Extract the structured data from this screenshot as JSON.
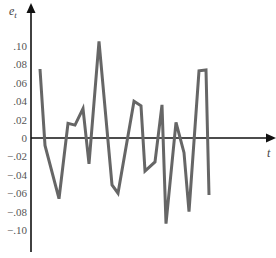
{
  "chart_data": {
    "type": "line",
    "title": "",
    "xlabel": "t",
    "ylabel": "e_t",
    "ylabel_main": "e",
    "ylabel_sub": "t",
    "yticks": [
      ".10",
      ".08",
      ".06",
      ".04",
      ".02",
      "0",
      "−.02",
      "−.04",
      "−.06",
      "−.08",
      "−.10"
    ],
    "ytick_values": [
      0.1,
      0.08,
      0.06,
      0.04,
      0.02,
      0,
      -0.02,
      -0.04,
      -0.06,
      -0.08,
      -0.1
    ],
    "ylim": [
      -0.12,
      0.14
    ],
    "grid": false,
    "legend": null,
    "series": [
      {
        "name": "e_t",
        "color": "#666666",
        "x": [
          40,
          45,
          59,
          68,
          75,
          83,
          89,
          99,
          112,
          118,
          134,
          141,
          145,
          155,
          162,
          166,
          176,
          184,
          189,
          199,
          206,
          209
        ],
        "values": [
          0.075,
          -0.008,
          -0.066,
          0.016,
          0.014,
          0.032,
          -0.028,
          0.105,
          -0.051,
          -0.06,
          0.04,
          0.035,
          -0.036,
          -0.026,
          0.036,
          -0.093,
          0.017,
          -0.016,
          -0.08,
          0.073,
          0.074,
          -0.062
        ]
      }
    ]
  },
  "axes": {
    "x_label": "t",
    "y_label_main": "e",
    "y_label_sub": "t"
  }
}
